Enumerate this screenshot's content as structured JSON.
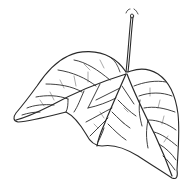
{
  "image": {
    "subject": "leaf line drawing",
    "background_color": "#ffffff",
    "line_color": "#2a2a2a",
    "width": 188,
    "height": 189
  },
  "leaf": {
    "lobes": 3,
    "has_stem": true
  }
}
